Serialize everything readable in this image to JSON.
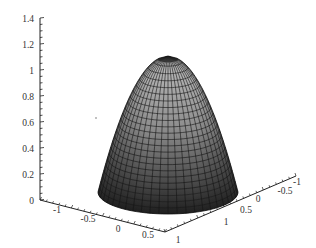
{
  "chart_data": {
    "type": "surface3d",
    "title": "",
    "surface": "paraboloid z = 1 - x^2 - y^2 (dome, clipped at z >= 0)",
    "xlabel": "",
    "ylabel": "",
    "zlabel": "",
    "x_ticks": [
      "-1",
      "-0.5",
      "0",
      "0.5",
      "1"
    ],
    "y_ticks": [
      "1",
      "0.5",
      "0",
      "-0.5",
      "-1"
    ],
    "z_ticks": [
      "0",
      "0.2",
      "0.4",
      "0.6",
      "0.8",
      "1",
      "1.2",
      "1.4"
    ],
    "xlim": [
      -1,
      1
    ],
    "ylim": [
      -1,
      1
    ],
    "zlim": [
      0,
      1.4
    ],
    "peak": {
      "x": 0,
      "y": 0,
      "z": 1.05
    },
    "base_radius": 1,
    "grid": false,
    "legend": null,
    "shading": "grayscale, darker toward base",
    "mesh_color": "#1a1a1a"
  },
  "axes": {
    "z": {
      "labels": [
        "1.4",
        "1.2",
        "1",
        "0.8",
        "0.6",
        "0.4",
        "0.2",
        "0"
      ]
    },
    "x": {
      "labels": [
        "-1",
        "-0.5",
        "0",
        "0.5",
        "1"
      ]
    },
    "y": {
      "labels": [
        "1",
        "0.5",
        "0",
        "-0.5",
        "-1"
      ]
    }
  }
}
